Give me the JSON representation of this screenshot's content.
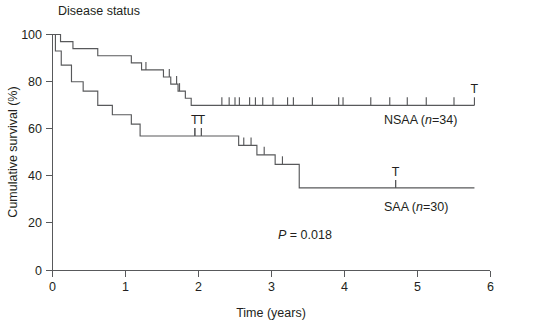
{
  "panel": {
    "title": "Disease status"
  },
  "chart_data": {
    "type": "line",
    "subtype": "kaplan-meier-survival",
    "title": "Disease status",
    "xlabel": "Time (years)",
    "ylabel": "Cumulative survival (%)",
    "xlim": [
      0,
      6
    ],
    "ylim": [
      0,
      100
    ],
    "xticks": [
      "0",
      "1",
      "2",
      "3",
      "4",
      "5",
      "6"
    ],
    "xtick_values": [
      0,
      1,
      2,
      3,
      4,
      5,
      6
    ],
    "yticks": [
      "0",
      "20",
      "40",
      "60",
      "80",
      "100"
    ],
    "ytick_values": [
      0,
      20,
      40,
      60,
      80,
      100
    ],
    "grid": false,
    "legend_position": "inline-right-of-curve-end",
    "annotations": [
      {
        "text": "P = 0.018",
        "x": 3.05,
        "y": 23
      }
    ],
    "statistics": {
      "p_value": "0.018",
      "p_label": "P = 0.018"
    },
    "series": [
      {
        "name": "NSAA (n=34)",
        "group": "NSAA",
        "n": 34,
        "label": "NSAA (n=34)",
        "color": "#58595b",
        "final_survival": 70,
        "steps": [
          [
            0.0,
            100
          ],
          [
            0.11,
            100
          ],
          [
            0.11,
            97
          ],
          [
            0.28,
            97
          ],
          [
            0.28,
            94
          ],
          [
            0.62,
            94
          ],
          [
            0.62,
            91
          ],
          [
            1.08,
            91
          ],
          [
            1.08,
            88
          ],
          [
            1.22,
            88
          ],
          [
            1.22,
            85
          ],
          [
            1.52,
            85
          ],
          [
            1.52,
            82
          ],
          [
            1.62,
            82
          ],
          [
            1.62,
            79
          ],
          [
            1.72,
            79
          ],
          [
            1.72,
            76
          ],
          [
            1.82,
            76
          ],
          [
            1.82,
            73
          ],
          [
            1.9,
            73
          ],
          [
            1.9,
            70
          ],
          [
            5.78,
            70
          ]
        ],
        "censor_times": [
          1.28,
          1.6,
          1.7,
          1.74,
          2.32,
          2.42,
          2.5,
          2.56,
          2.7,
          2.78,
          2.88,
          3.02,
          3.22,
          3.3,
          3.56,
          3.92,
          3.98,
          4.36,
          4.62,
          4.86,
          5.12,
          5.5
        ],
        "terminal_mark": {
          "symbol": "T",
          "x": 5.78
        }
      },
      {
        "name": "SAA (n=30)",
        "group": "SAA",
        "n": 30,
        "label": "SAA (n=30)",
        "color": "#58595b",
        "final_survival": 35,
        "steps": [
          [
            0.0,
            100
          ],
          [
            0.04,
            100
          ],
          [
            0.04,
            93
          ],
          [
            0.12,
            93
          ],
          [
            0.12,
            87
          ],
          [
            0.26,
            87
          ],
          [
            0.26,
            80
          ],
          [
            0.42,
            80
          ],
          [
            0.42,
            76
          ],
          [
            0.62,
            76
          ],
          [
            0.62,
            70
          ],
          [
            0.82,
            70
          ],
          [
            0.82,
            66
          ],
          [
            1.08,
            66
          ],
          [
            1.08,
            62
          ],
          [
            1.2,
            62
          ],
          [
            1.2,
            57
          ],
          [
            2.55,
            57
          ],
          [
            2.55,
            53
          ],
          [
            2.8,
            53
          ],
          [
            2.8,
            49
          ],
          [
            3.05,
            49
          ],
          [
            3.05,
            45
          ],
          [
            3.38,
            45
          ],
          [
            3.38,
            35
          ],
          [
            5.78,
            35
          ]
        ],
        "censor_times": [
          1.95,
          2.04,
          2.62,
          2.72,
          2.9,
          3.15,
          4.7
        ],
        "terminal_marks": [
          {
            "symbol": "T",
            "x": 1.95
          },
          {
            "symbol": "T",
            "x": 2.04
          },
          {
            "symbol": "T",
            "x": 4.7
          }
        ]
      }
    ]
  },
  "labels": {
    "nsaa_prefix": "NSAA (",
    "nsaa_n_italic": "n",
    "nsaa_n_value": "=34)",
    "saa_prefix": "SAA (",
    "saa_n_italic": "n",
    "saa_n_value": "=30)",
    "p_italic": "P",
    "p_rest": " = 0.018",
    "t_symbol": "T"
  }
}
